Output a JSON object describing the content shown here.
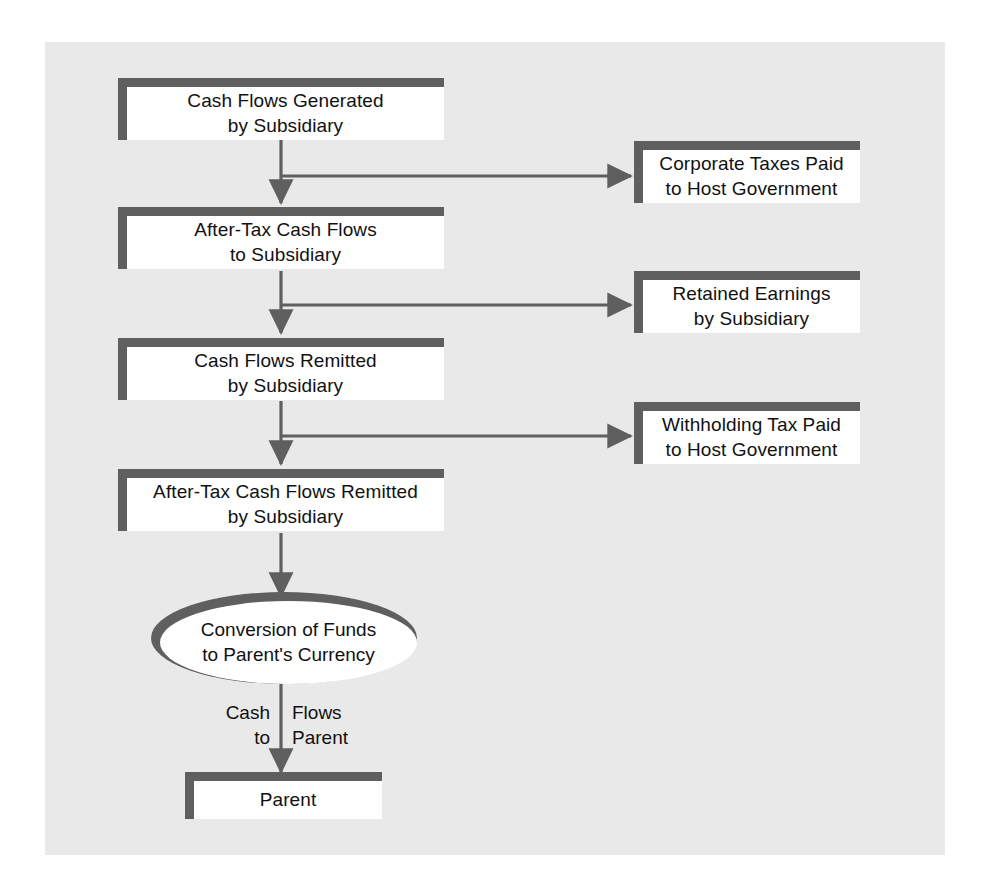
{
  "diagram": {
    "colors": {
      "panel_background": "#e9e9e9",
      "page_background": "#ffffff",
      "box_fill": "#ffffff",
      "box_border": "#5f5f5f",
      "connector": "#5f5f5f",
      "text": "#111111"
    },
    "main_nodes": [
      {
        "id": "cash-flows-generated",
        "line1": "Cash Flows Generated",
        "line2": "by Subsidiary"
      },
      {
        "id": "after-tax-cash-flows",
        "line1": "After-Tax Cash Flows",
        "line2": "to Subsidiary"
      },
      {
        "id": "cash-flows-remitted",
        "line1": "Cash Flows Remitted",
        "line2": "by Subsidiary"
      },
      {
        "id": "after-tax-remitted",
        "line1": "After-Tax Cash Flows Remitted",
        "line2": "by Subsidiary"
      }
    ],
    "branch_nodes": [
      {
        "id": "corporate-taxes",
        "line1": "Corporate Taxes Paid",
        "line2": "to Host Government"
      },
      {
        "id": "retained-earnings",
        "line1": "Retained Earnings",
        "line2": "by Subsidiary"
      },
      {
        "id": "withholding-tax",
        "line1": "Withholding Tax Paid",
        "line2": "to Host Government"
      }
    ],
    "conversion": {
      "id": "conversion-of-funds",
      "line1": "Conversion of Funds",
      "line2": "to Parent's Currency"
    },
    "flow_label": {
      "left_line1": "Cash",
      "left_line2": "to",
      "right_line1": "Flows",
      "right_line2": "Parent"
    },
    "terminal": {
      "id": "parent",
      "label": "Parent"
    }
  }
}
